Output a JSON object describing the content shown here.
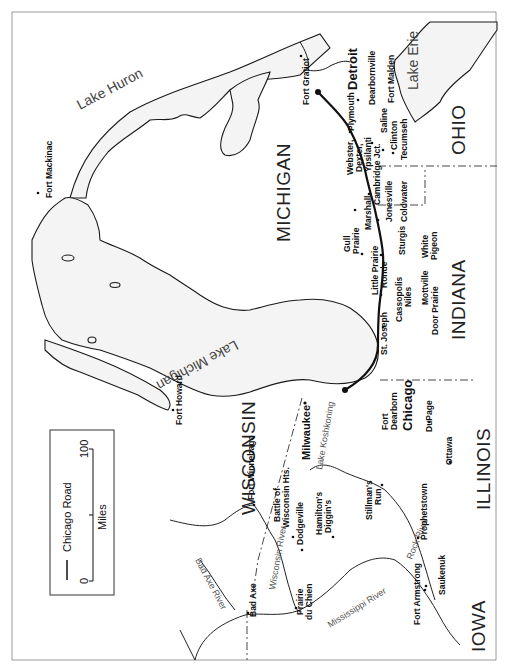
{
  "map": {
    "orientation": "rotated 90 degrees counterclockwise",
    "legend": {
      "road_label": "Chicago Road",
      "scale_units": "Miles",
      "scale_min": "0",
      "scale_max": "100"
    },
    "states": {
      "michigan": "MICHIGAN",
      "wisconsin": "WISCONSIN",
      "indiana": "INDIANA",
      "illinois": "ILLINOIS",
      "ohio": "OHIO",
      "iowa": "IOWA"
    },
    "water": {
      "lake_huron": "Lake Huron",
      "lake_michigan": "Lake Michigan",
      "lake_erie": "Lake Erie",
      "lake_koshkonong": "Lake Koshkoning",
      "wisconsin_river": "Wisconsin River",
      "mississippi_river": "Mississippi River",
      "rock_river": "Rock River",
      "bad_axe_river": "Bad Axe River"
    },
    "cities": {
      "detroit": "Detroit",
      "chicago": "Chicago",
      "milwaukee": "Milwaukee"
    },
    "towns": {
      "fort_gratiot": "Fort Gratiot",
      "fort_mackinac": "Fort Mackinac",
      "fort_howard": "Fort Howard",
      "dearbornville": "Dearbornville",
      "fort_malden": "Fort Malden",
      "plymouth": "Plymouth",
      "saline": "Saline",
      "clinton": "Clinton",
      "tecumseh": "Tecumseh",
      "webster": "Webster,",
      "dexter": "Dexter,",
      "ypsilanti": "Ypsilanti",
      "cambridge_jct": "Cambridge Jct.",
      "jonesville": "Jonesville",
      "coldwater": "Coldwater",
      "marshall": "Marshall",
      "gull_prairie_1": "Gull",
      "gull_prairie_2": "Prairie",
      "sturgis": "Sturgis",
      "white_pigeon_1": "White",
      "white_pigeon_2": "Pigeon",
      "little_prairie_ronde_1": "Little Prairie",
      "little_prairie_ronde_2": "Ronde",
      "cassopolis": "Cassopolis",
      "niles": "Niles",
      "mottville": "Mottville",
      "st_joseph": "St. Joseph",
      "door_prairie": "Door Prairie",
      "fort_dearborn_1": "Fort",
      "fort_dearborn_2": "Dearborn",
      "dupage": "DuPage",
      "ottawa": "Ottawa",
      "fort_winnebago": "Fort Winnebago",
      "battle_wisconsin_hts_1": "Battle of",
      "battle_wisconsin_hts_2": "Wisconsin Hts.",
      "dodgeville": "Dodgeville",
      "hamiltons_diggins_1": "Hamilton's",
      "hamiltons_diggins_2": "Diggin's",
      "stillmans_run_1": "Stillman's",
      "stillmans_run_2": "Run",
      "prophetstown": "Prophetstown",
      "saukenuk": "Saukenuk",
      "fort_armstrong": "Fort Armstrong",
      "bad_axe": "Bad Axe",
      "prairie_du_chien_1": "Prairie",
      "prairie_du_chien_2": "du Chien"
    }
  }
}
